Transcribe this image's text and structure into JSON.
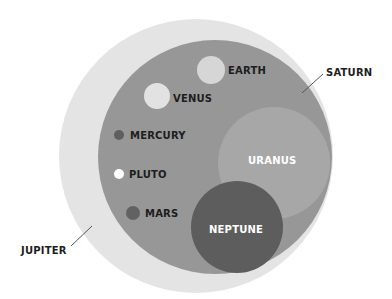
{
  "diagram": {
    "colors": {
      "jupiter": "#e4e4e4",
      "saturn": "#979797",
      "uranus": "#a9a9a9",
      "neptune": "#5d5d5d",
      "earth": "#d6d6d6",
      "venus": "#e2e2e2",
      "mercury": "#5f5f5f",
      "pluto": "#ffffff",
      "mars": "#626262",
      "label_dark": "#1e1e1e",
      "label_light": "#ffffff",
      "leader": "#555555"
    },
    "planets": [
      {
        "name": "JUPITER",
        "cx": 196,
        "cy": 156,
        "r": 137
      },
      {
        "name": "SATURN",
        "cx": 215,
        "cy": 157,
        "r": 117
      },
      {
        "name": "URANUS",
        "cx": 274,
        "cy": 163,
        "r": 56
      },
      {
        "name": "NEPTUNE",
        "cx": 237,
        "cy": 227,
        "r": 46
      },
      {
        "name": "EARTH",
        "cx": 211,
        "cy": 70,
        "r": 14
      },
      {
        "name": "VENUS",
        "cx": 157,
        "cy": 96,
        "r": 13
      },
      {
        "name": "MERCURY",
        "cx": 119,
        "cy": 135,
        "r": 5
      },
      {
        "name": "PLUTO",
        "cx": 119,
        "cy": 174,
        "r": 5
      },
      {
        "name": "MARS",
        "cx": 133,
        "cy": 213,
        "r": 7
      }
    ],
    "labels": {
      "jupiter": "JUPITER",
      "saturn": "SATURN",
      "uranus": "URANUS",
      "neptune": "NEPTUNE",
      "earth": "EARTH",
      "venus": "VENUS",
      "mercury": "MERCURY",
      "pluto": "PLUTO",
      "mars": "MARS"
    }
  }
}
